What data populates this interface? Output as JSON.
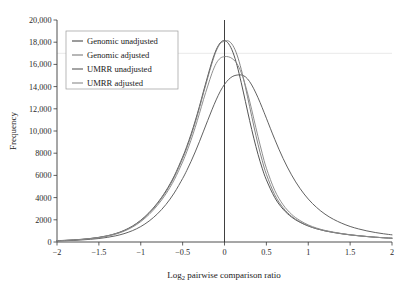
{
  "figure": {
    "title": "",
    "background": "#ffffff"
  },
  "chart_data": {
    "type": "line",
    "title": "",
    "subtitle": "",
    "xlabel": "Log2 pairwise comparison ratio",
    "xlabel_base": "Log",
    "xlabel_sub": "2",
    "xlabel_rest": " pairwise comparison ratio",
    "ylabel": "Frequency",
    "xlim": [
      -2,
      2
    ],
    "ylim": [
      0,
      20000
    ],
    "grid": false,
    "gridlines_y": [
      17000
    ],
    "legend_position": "upper-left",
    "reference_line_x": 0,
    "xticks": [
      -2,
      -1.5,
      -1,
      -0.5,
      0,
      0.5,
      1,
      1.5,
      2
    ],
    "xticklabels": [
      "−2",
      "−1.5",
      "−1",
      "−0.5",
      "0",
      "0.5",
      "1",
      "1.5",
      "2"
    ],
    "yticks": [
      0,
      2000,
      4000,
      6000,
      8000,
      10000,
      12000,
      14000,
      16000,
      18000,
      20000
    ],
    "yticklabels": [
      "0",
      "2000",
      "4000",
      "6000",
      "8000",
      "10,000",
      "12,000",
      "14,000",
      "16,000",
      "18,000",
      "20,000"
    ],
    "x": [
      -2.0,
      -1.9,
      -1.8,
      -1.7,
      -1.6,
      -1.5,
      -1.4,
      -1.3,
      -1.2,
      -1.1,
      -1.0,
      -0.9,
      -0.8,
      -0.7,
      -0.6,
      -0.5,
      -0.45,
      -0.4,
      -0.35,
      -0.3,
      -0.25,
      -0.2,
      -0.15,
      -0.1,
      -0.05,
      0.0,
      0.05,
      0.1,
      0.15,
      0.2,
      0.25,
      0.3,
      0.35,
      0.4,
      0.45,
      0.5,
      0.6,
      0.7,
      0.8,
      0.9,
      1.0,
      1.1,
      1.2,
      1.3,
      1.4,
      1.5,
      1.6,
      1.7,
      1.8,
      1.9,
      2.0
    ],
    "series": [
      {
        "name": "Genomic unadjusted",
        "color": "#4a4a4a",
        "peak_x": 0.0,
        "peak_y": 18150,
        "values": [
          120,
          150,
          190,
          245,
          320,
          420,
          560,
          760,
          1040,
          1430,
          1960,
          2650,
          3520,
          4600,
          5950,
          7650,
          8620,
          9700,
          10900,
          12200,
          13600,
          14950,
          16250,
          17300,
          17950,
          18150,
          17850,
          17100,
          15900,
          14350,
          12650,
          10950,
          9350,
          7900,
          6650,
          5600,
          4000,
          2950,
          2250,
          1780,
          1440,
          1190,
          1000,
          860,
          740,
          640,
          560,
          490,
          430,
          380,
          340
        ]
      },
      {
        "name": "Genomic adjusted",
        "color": "#7d7d7d",
        "peak_x": 0.05,
        "peak_y": 18100,
        "values": [
          115,
          145,
          185,
          238,
          310,
          408,
          545,
          740,
          1015,
          1395,
          1915,
          2590,
          3450,
          4510,
          5840,
          7520,
          8480,
          9550,
          10750,
          12050,
          13450,
          14800,
          16100,
          17200,
          17880,
          18080,
          18100,
          17700,
          16850,
          15550,
          13950,
          12200,
          10450,
          8800,
          7350,
          6100,
          4250,
          3080,
          2320,
          1820,
          1460,
          1200,
          1005,
          862,
          742,
          642,
          560,
          490,
          430,
          380,
          340
        ]
      },
      {
        "name": "UMRR unadjusted",
        "color": "#5a5a5a",
        "peak_x": 0.22,
        "peak_y": 15050,
        "values": [
          95,
          118,
          148,
          188,
          242,
          315,
          415,
          555,
          750,
          1020,
          1390,
          1890,
          2540,
          3370,
          4420,
          5720,
          6450,
          7250,
          8110,
          9030,
          9990,
          10960,
          11910,
          12800,
          13580,
          14200,
          14650,
          14930,
          15040,
          15050,
          14880,
          14450,
          13800,
          13000,
          12100,
          11150,
          9250,
          7520,
          6050,
          4840,
          3870,
          3110,
          2510,
          2050,
          1690,
          1400,
          1180,
          1000,
          855,
          740,
          645
        ]
      },
      {
        "name": "UMRR adjusted",
        "color": "#8a8a8a",
        "peak_x": 0.1,
        "peak_y": 16700,
        "values": [
          110,
          138,
          176,
          227,
          296,
          390,
          522,
          708,
          972,
          1336,
          1835,
          2482,
          3308,
          4325,
          5600,
          7210,
          8140,
          9170,
          10320,
          11560,
          12850,
          14050,
          15200,
          16080,
          16560,
          16700,
          16680,
          16480,
          16050,
          15250,
          14100,
          12700,
          11100,
          9500,
          8000,
          6650,
          4650,
          3350,
          2500,
          1940,
          1540,
          1255,
          1045,
          890,
          762,
          658,
          572,
          500,
          438,
          386,
          344
        ]
      }
    ]
  },
  "legend": {
    "items": [
      {
        "label": "Genomic unadjusted",
        "color": "#4a4a4a"
      },
      {
        "label": "Genomic adjusted",
        "color": "#7d7d7d"
      },
      {
        "label": "UMRR unadjusted",
        "color": "#5a5a5a"
      },
      {
        "label": "UMRR adjusted",
        "color": "#8a8a8a"
      }
    ]
  }
}
